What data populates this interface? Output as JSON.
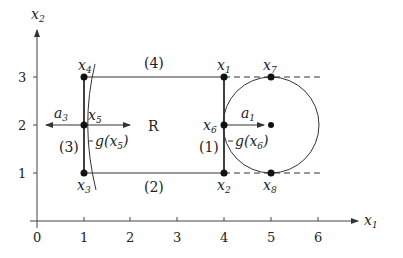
{
  "diagram": {
    "axes": {
      "x_label": "x",
      "x_label_sub": "1",
      "y_label": "x",
      "y_label_sub": "2",
      "x_ticks": [
        "0",
        "1",
        "2",
        "3",
        "4",
        "5",
        "6"
      ],
      "y_ticks": [
        "1",
        "2",
        "3"
      ]
    },
    "region_label": "R",
    "edge_labels": {
      "e1": "(1)",
      "e2": "(2)",
      "e3": "(3)",
      "e4": "(4)"
    },
    "points": [
      {
        "name": "x",
        "sub": "1",
        "x": 4,
        "y": 3
      },
      {
        "name": "x",
        "sub": "2",
        "x": 4,
        "y": 1
      },
      {
        "name": "x",
        "sub": "3",
        "x": 1,
        "y": 1
      },
      {
        "name": "x",
        "sub": "4",
        "x": 1,
        "y": 3
      },
      {
        "name": "x",
        "sub": "5",
        "x": 1,
        "y": 2
      },
      {
        "name": "x",
        "sub": "6",
        "x": 4,
        "y": 2
      },
      {
        "name": "x",
        "sub": "7",
        "x": 5,
        "y": 3
      },
      {
        "name": "x",
        "sub": "8",
        "x": 5,
        "y": 1
      }
    ],
    "vectors": {
      "a1": {
        "name": "a",
        "sub": "1"
      },
      "a3": {
        "name": "a",
        "sub": "3"
      },
      "g5": {
        "text": "g(x",
        "sub": "5",
        "close": ")"
      },
      "g6": {
        "text": "g(x",
        "sub": "6",
        "close": ")"
      }
    },
    "circle": {
      "center": [
        5,
        2
      ],
      "radius": 1
    }
  }
}
